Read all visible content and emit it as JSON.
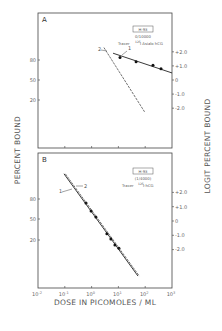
{
  "chart_data": [
    {
      "type": "scatter",
      "panel": "A",
      "box_label": "H-93",
      "dilution": "0/10000",
      "tracer": "Tracer 125I Asialo hCG",
      "xscale": "log",
      "xlim": [
        0.01,
        1000
      ],
      "y_left_ticks": [
        "80",
        "50",
        "20"
      ],
      "y_right_ticks": [
        "+2.0",
        "+1.0",
        "0",
        "-1.0",
        "-2.0"
      ],
      "y_right_values": [
        2,
        1,
        0,
        -1,
        -2
      ],
      "ylim_logit": [
        -5.8,
        4.8
      ],
      "series": [
        {
          "name": "1",
          "style": "solid",
          "points_log10dose": [
            1.06,
            1.66,
            2.29,
            2.59
          ],
          "points_logit": [
            1.6,
            1.3,
            1.05,
            0.8
          ],
          "line_log10dose": [
            0.8,
            3.0
          ],
          "line_logit": [
            1.9,
            0.5
          ]
        },
        {
          "name": "2",
          "style": "dashed",
          "points_log10dose": [],
          "points_logit": [],
          "line_log10dose": [
            0.46,
            1.99
          ],
          "line_logit": [
            2.3,
            -2.3
          ]
        }
      ]
    },
    {
      "type": "scatter",
      "panel": "B",
      "box_label": "H-93",
      "dilution": "(1/4000)",
      "tracer": "Tracer 125I-hCG",
      "xscale": "log",
      "xlim": [
        0.01,
        1000
      ],
      "x_ticks": [
        "10-2",
        "10-1",
        "100",
        "101",
        "102",
        "103"
      ],
      "xlabel": "DOSE IN PICOMOLES / ML",
      "y_left_ticks": [
        "80",
        "50",
        "20"
      ],
      "y_right_ticks": [
        "+2.0",
        "+1.0",
        "0",
        "-1.0",
        "-2.0"
      ],
      "y_right_values": [
        2,
        1,
        0,
        -1,
        -2
      ],
      "ylim_logit": [
        -4.7,
        4.7
      ],
      "series": [
        {
          "name": "1",
          "style": "solid",
          "points_log10dose": [
            -0.21,
            -0.02,
            0.16,
            0.57,
            0.72,
            0.87,
            1.02
          ],
          "points_logit": [
            1.26,
            0.7,
            0.28,
            -0.9,
            -1.26,
            -1.68,
            -1.9
          ],
          "line_log10dose": [
            -1.03,
            1.73
          ],
          "line_logit": [
            3.3,
            -3.85
          ]
        },
        {
          "name": "2",
          "style": "dashed",
          "points_log10dose": [],
          "points_logit": [],
          "line_log10dose": [
            -0.98,
            1.78
          ],
          "line_logit": [
            3.3,
            -3.85
          ]
        }
      ]
    }
  ],
  "labels": {
    "ylabel_left": "PERCENT BOUND",
    "ylabel_right": "LOGIT PERCENT BOUND",
    "panel_a": "A",
    "panel_b": "B",
    "series1": "1",
    "series2": "2",
    "tracer_word": "Tracer",
    "a_iso": "125",
    "a_tracer_rest": "I Asialo hCG",
    "b_iso": "125",
    "b_tracer_rest": "I-hCG",
    "x_ticks_base": "10",
    "x_ticks_exp": [
      "-2",
      "-1",
      "0",
      "1",
      "2",
      "3"
    ]
  }
}
